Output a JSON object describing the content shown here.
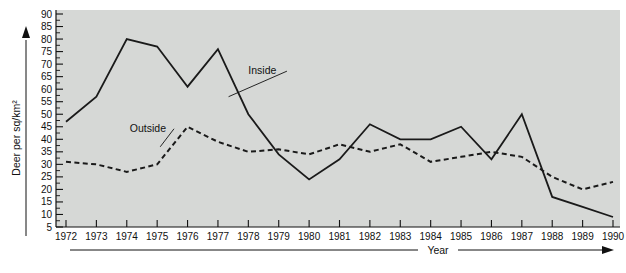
{
  "chart_data": {
    "type": "line",
    "title": "",
    "xlabel": "Year",
    "ylabel": "Deer per sq/km²",
    "grid": false,
    "legend_position": "inline-annotation",
    "plot_background": "#d6d8d6",
    "line_color": "#1a1a1a",
    "x": [
      1972,
      1973,
      1974,
      1975,
      1976,
      1977,
      1978,
      1979,
      1980,
      1981,
      1982,
      1983,
      1984,
      1985,
      1986,
      1987,
      1988,
      1989,
      1990
    ],
    "xlim": [
      1972,
      1990
    ],
    "ylim": [
      5,
      90
    ],
    "ytick_step": 5,
    "yticks": [
      5,
      10,
      15,
      20,
      25,
      30,
      35,
      40,
      45,
      50,
      55,
      60,
      65,
      70,
      75,
      80,
      85,
      90
    ],
    "xticks": [
      "1972",
      "1973",
      "1974",
      "1975",
      "1976",
      "1977",
      "1978",
      "1979",
      "1980",
      "1981",
      "1982",
      "1983",
      "1984",
      "1985",
      "1986",
      "1987",
      "1988",
      "1989",
      "1990"
    ],
    "series": [
      {
        "name": "Inside",
        "style": "solid",
        "label_x": 1978.0,
        "label_y": 66,
        "values": [
          47,
          57,
          80,
          77,
          61,
          76,
          50,
          34,
          24,
          32,
          46,
          40,
          40,
          45,
          32,
          50,
          17,
          13,
          9
        ]
      },
      {
        "name": "Outside",
        "style": "dashed",
        "label_x": 1974.1,
        "label_y": 43,
        "values": [
          31,
          30,
          27,
          30,
          45,
          39,
          35,
          36,
          34,
          38,
          35,
          38,
          31,
          33,
          35,
          33,
          25,
          20,
          23
        ]
      }
    ],
    "annotations": [
      {
        "text": "Inside",
        "leader_from": [
          1978.0,
          66
        ],
        "leader_to": [
          1977.35,
          57
        ]
      },
      {
        "text": "Outside",
        "leader_from": [
          1974.1,
          43
        ],
        "leader_to": [
          1975.1,
          37
        ]
      }
    ]
  }
}
